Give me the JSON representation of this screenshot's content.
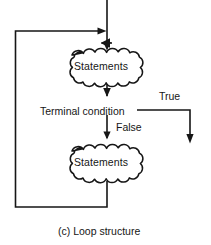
{
  "figure": {
    "caption": "(c) Loop structure",
    "type": "flowchart"
  },
  "nodes": {
    "statements_top": {
      "label": "Statements",
      "shape": "scalloped-cloud",
      "name": "statements-block-top"
    },
    "statements_bottom": {
      "label": "Statements",
      "shape": "scalloped-cloud",
      "name": "statements-block-bottom"
    },
    "terminal_condition": {
      "label": "Terminal condition",
      "shape": "text-only",
      "name": "terminal-condition"
    }
  },
  "branches": {
    "true_label": "True",
    "false_label": "False"
  },
  "edges": [
    {
      "name": "entry-arrow",
      "from": "top-entry",
      "to": "statements_top",
      "arrow": true
    },
    {
      "name": "loopback-join-arrow",
      "from": "loopback",
      "to": "main-spine",
      "arrow": true
    },
    {
      "name": "statements-top-to-condition",
      "from": "statements_top",
      "to": "terminal_condition",
      "arrow": true
    },
    {
      "name": "condition-false-to-statements-bottom",
      "from": "terminal_condition",
      "to": "statements_bottom",
      "arrow": true,
      "label": "False"
    },
    {
      "name": "condition-true-exit",
      "from": "terminal_condition",
      "to": "exit",
      "arrow": true,
      "label": "True"
    },
    {
      "name": "statements-bottom-to-loopback",
      "from": "statements_bottom",
      "to": "loopback",
      "arrow": false
    }
  ],
  "style": {
    "line_color": "#161616",
    "text_color": "#161616",
    "background": "#ffffff",
    "line_width": "1.6"
  }
}
